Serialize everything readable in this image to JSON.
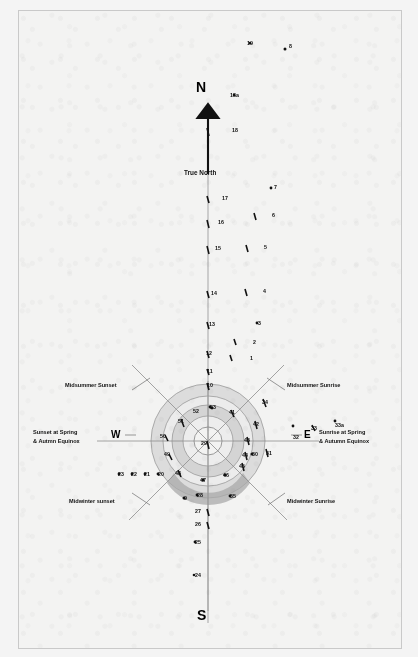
{
  "figure": {
    "type": "archaeoastronomy-site-plan",
    "background_color": "#f3f3f2",
    "ink_color": "#111111",
    "ring_fill_color": "#d9d9d9",
    "inner_band_color": "#b8b8b8",
    "line_color": "#8a8a8a"
  },
  "cardinals": {
    "north": "N",
    "south": "S",
    "east": "E",
    "west": "W",
    "true_north": "True North"
  },
  "annotations": [
    {
      "key": "midsummer_sunset",
      "text": "Midsummer Sunset"
    },
    {
      "key": "midsummer_sunrise",
      "text": "Midsummer Sunrise"
    },
    {
      "key": "equinox_sunset",
      "text": "Sunset at Spring\n& Autmn Equinox"
    },
    {
      "key": "equinox_sunset_l1",
      "text": "Sunset at Spring"
    },
    {
      "key": "equinox_sunset_l2",
      "text": "& Autmn Equinox"
    },
    {
      "key": "equinox_sunrise_l1",
      "text": "Sunrise at Spring"
    },
    {
      "key": "equinox_sunrise_l2",
      "text": "& Autumn Equinox"
    },
    {
      "key": "midwinter_sunset",
      "text": "Midwinter sunset"
    },
    {
      "key": "midwinter_sunrise",
      "text": "Midwinter Sunrise"
    }
  ],
  "markers": [
    {
      "id": "1",
      "label": "1",
      "x": 249,
      "y": 355
    },
    {
      "id": "2",
      "label": "2",
      "x": 252,
      "y": 339
    },
    {
      "id": "3",
      "label": "3",
      "x": 257,
      "y": 320
    },
    {
      "id": "4",
      "label": "4",
      "x": 262,
      "y": 288
    },
    {
      "id": "5",
      "label": "5",
      "x": 263,
      "y": 244
    },
    {
      "id": "6",
      "label": "6",
      "x": 271,
      "y": 212
    },
    {
      "id": "7",
      "label": "7",
      "x": 273,
      "y": 184
    },
    {
      "id": "8",
      "label": "8",
      "x": 288,
      "y": 43
    },
    {
      "id": "9",
      "label": "9",
      "x": 183,
      "y": 495
    },
    {
      "id": "10",
      "label": "10",
      "x": 206,
      "y": 382
    },
    {
      "id": "11",
      "label": "11",
      "x": 206,
      "y": 368
    },
    {
      "id": "12",
      "label": "12",
      "x": 205,
      "y": 350
    },
    {
      "id": "13",
      "label": "13",
      "x": 208,
      "y": 321
    },
    {
      "id": "14",
      "label": "14",
      "x": 210,
      "y": 290
    },
    {
      "id": "15",
      "label": "15",
      "x": 214,
      "y": 245
    },
    {
      "id": "16",
      "label": "16",
      "x": 217,
      "y": 219
    },
    {
      "id": "17",
      "label": "17",
      "x": 221,
      "y": 195
    },
    {
      "id": "18",
      "label": "18",
      "x": 231,
      "y": 127
    },
    {
      "id": "18a",
      "label": "18a",
      "x": 229,
      "y": 92
    },
    {
      "id": "19",
      "label": "19",
      "x": 246,
      "y": 40
    },
    {
      "id": "20",
      "label": "20",
      "x": 157,
      "y": 471
    },
    {
      "id": "21",
      "label": "21",
      "x": 143,
      "y": 471
    },
    {
      "id": "22",
      "label": "22",
      "x": 130,
      "y": 471
    },
    {
      "id": "23",
      "label": "23",
      "x": 117,
      "y": 471
    },
    {
      "id": "24",
      "label": "24",
      "x": 194,
      "y": 572
    },
    {
      "id": "25",
      "label": "25",
      "x": 194,
      "y": 539
    },
    {
      "id": "26",
      "label": "26",
      "x": 194,
      "y": 521
    },
    {
      "id": "27",
      "label": "27",
      "x": 194,
      "y": 508
    },
    {
      "id": "28",
      "label": "28",
      "x": 196,
      "y": 492
    },
    {
      "id": "29",
      "label": "29",
      "x": 200,
      "y": 440
    },
    {
      "id": "30",
      "label": "30",
      "x": 251,
      "y": 451
    },
    {
      "id": "31",
      "label": "31",
      "x": 265,
      "y": 450
    },
    {
      "id": "32",
      "label": "32",
      "x": 292,
      "y": 434
    },
    {
      "id": "33",
      "label": "33",
      "x": 310,
      "y": 425
    },
    {
      "id": "33a",
      "label": "33a",
      "x": 334,
      "y": 422
    },
    {
      "id": "34",
      "label": "34",
      "x": 261,
      "y": 399
    },
    {
      "id": "35",
      "label": "35",
      "x": 229,
      "y": 493
    },
    {
      "id": "41",
      "label": "41",
      "x": 228,
      "y": 409
    },
    {
      "id": "42",
      "label": "42",
      "x": 252,
      "y": 421
    },
    {
      "id": "43",
      "label": "43",
      "x": 243,
      "y": 437
    },
    {
      "id": "44",
      "label": "44",
      "x": 241,
      "y": 452
    },
    {
      "id": "45",
      "label": "45",
      "x": 238,
      "y": 463
    },
    {
      "id": "46",
      "label": "46",
      "x": 222,
      "y": 472
    },
    {
      "id": "47",
      "label": "47",
      "x": 199,
      "y": 477
    },
    {
      "id": "48",
      "label": "48",
      "x": 174,
      "y": 470
    },
    {
      "id": "49",
      "label": "49",
      "x": 163,
      "y": 451
    },
    {
      "id": "50",
      "label": "50",
      "x": 159,
      "y": 433
    },
    {
      "id": "51",
      "label": "51",
      "x": 177,
      "y": 418
    },
    {
      "id": "52",
      "label": "52",
      "x": 192,
      "y": 408
    },
    {
      "id": "53",
      "label": "53",
      "x": 209,
      "y": 404
    }
  ],
  "geometry": {
    "center_x": 207,
    "center_y": 440,
    "radii": [
      12,
      27,
      42,
      57
    ],
    "sightline_bearings_deg": [
      45,
      90,
      135,
      225,
      270,
      315
    ]
  }
}
